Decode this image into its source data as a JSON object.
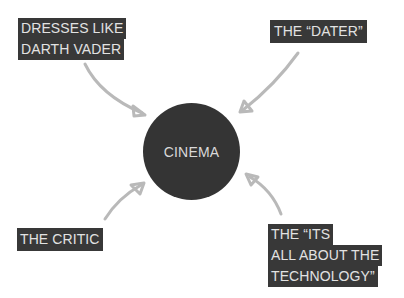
{
  "diagram": {
    "center": {
      "label": "CINEMA",
      "color": "#343434"
    },
    "nodes": [
      {
        "id": "darth",
        "lines": [
          "DRESSES LIKE",
          "DARTH VADER"
        ]
      },
      {
        "id": "dater",
        "lines": [
          "THE “DATER”"
        ]
      },
      {
        "id": "critic",
        "lines": [
          "THE CRITIC"
        ]
      },
      {
        "id": "tech",
        "lines": [
          "THE “ITS",
          "ALL ABOUT THE",
          "TECHNOLOGY”"
        ]
      }
    ],
    "colors": {
      "label_bg": "#383838",
      "label_text": "#e2e2e2",
      "arrow": "#b9b9b9",
      "background": "#ffffff"
    }
  }
}
